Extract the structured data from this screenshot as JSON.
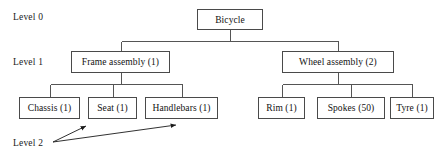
{
  "diagram": {
    "levels": [
      {
        "label": "Level 0",
        "x": 13,
        "y": 12
      },
      {
        "label": "Level 1",
        "x": 13,
        "y": 57
      },
      {
        "label": "Level 2",
        "x": 13,
        "y": 138
      }
    ],
    "nodes": [
      {
        "id": "bicycle",
        "label": "Bicycle",
        "level": 0,
        "x": 197,
        "y": 9,
        "w": 66,
        "h": 21
      },
      {
        "id": "frame-assembly",
        "label": "Frame assembly (1)",
        "level": 1,
        "x": 71,
        "y": 51,
        "w": 99,
        "h": 22
      },
      {
        "id": "wheel-assembly",
        "label": "Wheel assembly (2)",
        "level": 1,
        "x": 282,
        "y": 51,
        "w": 112,
        "h": 22
      },
      {
        "id": "chassis",
        "label": "Chassis (1)",
        "level": 2,
        "x": 19,
        "y": 97,
        "w": 61,
        "h": 22
      },
      {
        "id": "seat",
        "label": "Seat (1)",
        "level": 2,
        "x": 88,
        "y": 97,
        "w": 49,
        "h": 22
      },
      {
        "id": "handlebars",
        "label": "Handlebars (1)",
        "level": 2,
        "x": 145,
        "y": 97,
        "w": 73,
        "h": 22
      },
      {
        "id": "rim",
        "label": "Rim (1)",
        "level": 2,
        "x": 258,
        "y": 97,
        "w": 47,
        "h": 22
      },
      {
        "id": "spokes",
        "label": "Spokes (50)",
        "level": 2,
        "x": 317,
        "y": 97,
        "w": 68,
        "h": 22
      },
      {
        "id": "tyre",
        "label": "Tyre (1)",
        "level": 2,
        "x": 390,
        "y": 97,
        "w": 44,
        "h": 22
      }
    ],
    "connectors": [
      {
        "from": "bicycle",
        "to": "frame-assembly",
        "bus_y": 41
      },
      {
        "from": "bicycle",
        "to": "wheel-assembly",
        "bus_y": 41
      },
      {
        "from": "frame-assembly",
        "to": "chassis",
        "bus_y": 84
      },
      {
        "from": "frame-assembly",
        "to": "seat",
        "bus_y": 84
      },
      {
        "from": "frame-assembly",
        "to": "handlebars",
        "bus_y": 84
      },
      {
        "from": "wheel-assembly",
        "to": "rim",
        "bus_y": 84
      },
      {
        "from": "wheel-assembly",
        "to": "spokes",
        "bus_y": 84
      },
      {
        "from": "wheel-assembly",
        "to": "tyre",
        "bus_y": 84
      }
    ],
    "annotation_arrows": [
      {
        "id": "level2-to-seat",
        "x1": 53,
        "y1": 142,
        "x2": 86,
        "y2": 126
      },
      {
        "id": "level2-to-handlebars",
        "x1": 53,
        "y1": 142,
        "x2": 176,
        "y2": 125
      }
    ],
    "colors": {
      "box_border": "#4a4a4a",
      "box_fill": "#ffffff",
      "text": "#111111",
      "edge": "#555555",
      "arrow": "#1a1a1a",
      "background": "#ffffff"
    }
  }
}
